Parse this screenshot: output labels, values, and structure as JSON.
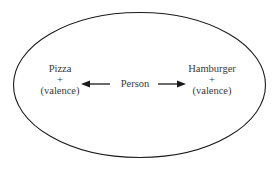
{
  "diagram": {
    "type": "field-diagram",
    "boundary": "ellipse",
    "center": {
      "label": "Person"
    },
    "left": {
      "title": "Pizza",
      "sign": "+",
      "note": "(valence)"
    },
    "right": {
      "title": "Hamburger",
      "sign": "+",
      "note": "(valence)"
    },
    "edges": [
      {
        "from": "Person",
        "to": "Pizza",
        "direction": "left"
      },
      {
        "from": "Person",
        "to": "Hamburger",
        "direction": "right"
      }
    ],
    "colors": {
      "stroke": "#1a1a1a",
      "text": "#3a3a3a",
      "background": "#ffffff"
    }
  }
}
